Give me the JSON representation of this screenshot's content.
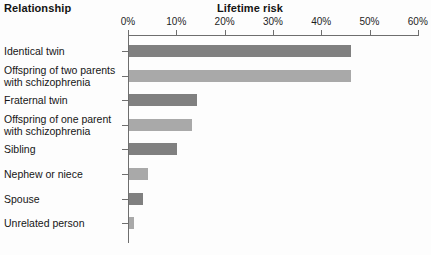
{
  "header": {
    "left_title": "Relationship",
    "right_title": "Lifetime risk"
  },
  "chart_data": {
    "type": "bar",
    "orientation": "horizontal",
    "title": "Lifetime risk",
    "xlabel": "Lifetime risk",
    "ylabel": "Relationship",
    "xlim": [
      0,
      60
    ],
    "x_unit": "%",
    "grid": false,
    "legend": null,
    "tick_labels": [
      "0%",
      "10%",
      "20%",
      "30%",
      "40%",
      "50%",
      "60%"
    ],
    "tick_values": [
      0,
      10,
      20,
      30,
      40,
      50,
      60
    ],
    "categories": [
      "Identical twin",
      "Offspring of two parents\nwith schizophrenia",
      "Fraternal twin",
      "Offspring of one parent\nwith schizophrenia",
      "Sibling",
      "Nephew or niece",
      "Spouse",
      "Unrelated person"
    ],
    "values": [
      46,
      46,
      14,
      13,
      10,
      4,
      3,
      1
    ],
    "bar_colors": [
      "#808080",
      "#a9a9a9",
      "#808080",
      "#a9a9a9",
      "#808080",
      "#a9a9a9",
      "#808080",
      "#a9a9a9"
    ],
    "colors": {
      "dark_bar": "#808080",
      "light_bar": "#a9a9a9",
      "axis": "#6e6e6e",
      "text": "#161616",
      "background": "#fdfdfd"
    }
  }
}
